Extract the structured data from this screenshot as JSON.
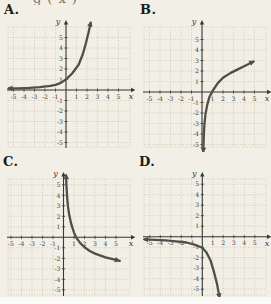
{
  "page": {
    "cropped_top_text": "g(x)"
  },
  "colors": {
    "background": "#f2efe7",
    "grid": "#c8bfa2",
    "axis": "#3a3936",
    "curve": "#504e4a",
    "tick_label": "#403e39"
  },
  "chart_data": [
    {
      "type": "line",
      "label": "A.",
      "xlabel": "x",
      "ylabel": "y",
      "xlim": [
        -5.5,
        6
      ],
      "ylim": [
        -5.5,
        6.5
      ],
      "x_ticks": [
        -5,
        -4,
        -3,
        -2,
        -1,
        1,
        2,
        3,
        4,
        5
      ],
      "y_ticks": [
        5,
        4,
        3,
        2,
        1,
        -1,
        -2,
        -3,
        -4,
        -5
      ],
      "grid": "on",
      "description": "Increasing exponential curve through (0,1) with horizontal asymptote y=0 on the left; arrows on both ends",
      "points": [
        [
          -5.45,
          0.15
        ],
        [
          -4.5,
          0.16
        ],
        [
          -3.5,
          0.2
        ],
        [
          -2.5,
          0.28
        ],
        [
          -1.5,
          0.4
        ],
        [
          -1,
          0.5
        ],
        [
          -0.5,
          0.68
        ],
        [
          0,
          1
        ],
        [
          0.6,
          1.6
        ],
        [
          1.2,
          2.4
        ],
        [
          1.6,
          3.4
        ],
        [
          1.9,
          4.5
        ],
        [
          2.15,
          5.5
        ],
        [
          2.35,
          6.4
        ]
      ],
      "start_arrow": true,
      "end_arrow": true
    },
    {
      "type": "line",
      "label": "B.",
      "xlabel": "x",
      "ylabel": "y",
      "xlim": [
        -5.5,
        6
      ],
      "ylim": [
        -6,
        6
      ],
      "x_ticks": [
        -5,
        -4,
        -3,
        -2,
        -1,
        1,
        2,
        3,
        4,
        5
      ],
      "y_ticks": [
        5,
        4,
        3,
        2,
        1,
        -1,
        -2,
        -3,
        -4,
        -5
      ],
      "grid": "on",
      "description": "Increasing logarithmic curve through (1,0) with vertical asymptote x=0; arrows on both ends",
      "points": [
        [
          0.12,
          -5.7
        ],
        [
          0.14,
          -5
        ],
        [
          0.18,
          -4
        ],
        [
          0.24,
          -3
        ],
        [
          0.33,
          -2.1
        ],
        [
          0.5,
          -1.2
        ],
        [
          0.7,
          -0.5
        ],
        [
          1,
          0.1
        ],
        [
          1.5,
          0.85
        ],
        [
          2,
          1.35
        ],
        [
          2.7,
          1.8
        ],
        [
          3.5,
          2.2
        ],
        [
          4.2,
          2.55
        ],
        [
          4.9,
          2.9
        ]
      ],
      "start_arrow": true,
      "end_arrow": true
    },
    {
      "type": "line",
      "label": "C.",
      "xlabel": "x",
      "ylabel": "y",
      "xlim": [
        -5.5,
        6
      ],
      "ylim": [
        -6,
        6
      ],
      "x_ticks": [
        -5,
        -4,
        -3,
        -2,
        -1,
        1,
        2,
        3,
        4,
        5
      ],
      "y_ticks": [
        5,
        4,
        3,
        2,
        1,
        -1,
        -2,
        -3,
        -4,
        -5
      ],
      "grid": "on",
      "description": "Decreasing logarithmic curve through about (1.2,0) with vertical asymptote x=0; arrows on both ends",
      "points": [
        [
          0.25,
          5.9
        ],
        [
          0.28,
          5
        ],
        [
          0.33,
          4
        ],
        [
          0.42,
          3
        ],
        [
          0.55,
          2.1
        ],
        [
          0.75,
          1.2
        ],
        [
          1,
          0.45
        ],
        [
          1.2,
          0
        ],
        [
          1.6,
          -0.55
        ],
        [
          2,
          -0.95
        ],
        [
          2.5,
          -1.3
        ],
        [
          3,
          -1.55
        ],
        [
          4,
          -1.9
        ],
        [
          5,
          -2.15
        ],
        [
          5.35,
          -2.25
        ]
      ],
      "start_arrow": true,
      "end_arrow": true
    },
    {
      "type": "line",
      "label": "D.",
      "xlabel": "x",
      "ylabel": "y",
      "xlim": [
        -5.5,
        6
      ],
      "ylim": [
        -6.5,
        5.5
      ],
      "x_ticks": [
        -5,
        -4,
        -3,
        -2,
        -1,
        1,
        2,
        3,
        4,
        5
      ],
      "y_ticks": [
        5,
        4,
        3,
        2,
        1,
        -1,
        -2,
        -3,
        -4,
        -5
      ],
      "grid": "on",
      "description": "Decreasing exponential curve through (0,-1) with horizontal asymptote y=0 on the left; arrows on both ends",
      "points": [
        [
          -5.5,
          -0.25
        ],
        [
          -4.5,
          -0.3
        ],
        [
          -3.5,
          -0.35
        ],
        [
          -2.5,
          -0.45
        ],
        [
          -1.5,
          -0.55
        ],
        [
          -0.75,
          -0.75
        ],
        [
          0,
          -1.05
        ],
        [
          0.4,
          -1.5
        ],
        [
          0.8,
          -2.3
        ],
        [
          1.1,
          -3.3
        ],
        [
          1.4,
          -4.5
        ],
        [
          1.62,
          -5.7
        ]
      ],
      "start_arrow": true,
      "end_arrow": true
    }
  ]
}
